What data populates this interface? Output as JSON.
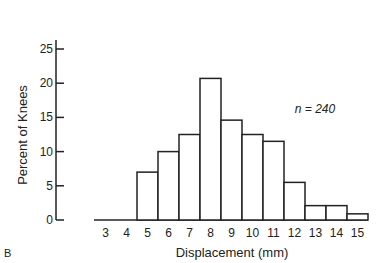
{
  "panel_label": "B",
  "chart_data": {
    "type": "bar",
    "title": "",
    "xlabel": "Displacement (mm)",
    "ylabel": "Percent of Knees",
    "categories": [
      "3",
      "4",
      "5",
      "6",
      "7",
      "8",
      "9",
      "10",
      "11",
      "12",
      "13",
      "14",
      "15"
    ],
    "values": [
      0,
      0,
      7,
      10,
      12.5,
      20.7,
      14.6,
      12.5,
      11.5,
      5.5,
      2.1,
      2.1,
      0.9
    ],
    "yticks": [
      0,
      5,
      10,
      15,
      20,
      25
    ],
    "ylim": [
      0,
      25
    ],
    "grid": false,
    "annotation": "n = 240"
  }
}
